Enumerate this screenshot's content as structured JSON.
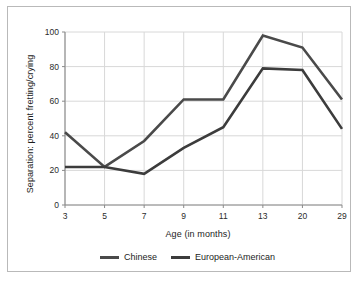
{
  "chart_data": {
    "type": "line",
    "title": "",
    "xlabel": "Age (in months)",
    "ylabel": "Separation: percent fretting/crying",
    "categories": [
      "3",
      "5",
      "7",
      "9",
      "11",
      "13",
      "20",
      "29"
    ],
    "ylim": [
      0,
      100
    ],
    "yticks": [
      "0",
      "20",
      "40",
      "60",
      "80",
      "100"
    ],
    "grid": "both",
    "legend_position": "bottom-center",
    "series": [
      {
        "name": "Chinese",
        "color": "#4a4a4a",
        "values": [
          42,
          22,
          37,
          61,
          61,
          98,
          91,
          61
        ]
      },
      {
        "name": "European-American",
        "color": "#3c3c3c",
        "values": [
          22,
          22,
          18,
          33,
          45,
          79,
          78,
          44
        ]
      }
    ]
  },
  "legend": {
    "items": [
      {
        "label": "Chinese"
      },
      {
        "label": "European-American"
      }
    ]
  },
  "colors": {
    "series_chinese": "#4a4a4a",
    "series_european_american": "#3c3c3c",
    "grid": "#d8d8d8",
    "axis": "#8a8a8a",
    "frame": "#b9b9b9",
    "text": "#1c1c1c",
    "background": "#ffffff"
  }
}
